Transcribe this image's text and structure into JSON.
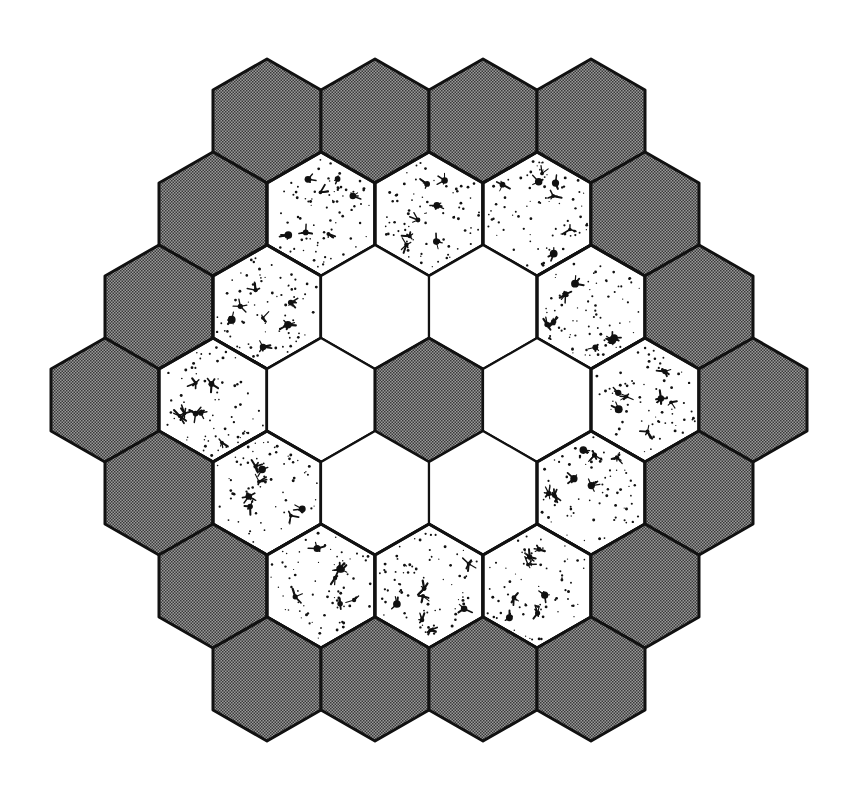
{
  "diagram": {
    "title": "",
    "colors": {
      "background": "#ffffff",
      "stroke": "#111111",
      "dark_fill": "#6e6e6e",
      "dark_fill_light": "#9a9a9a",
      "white_fill": "#ffffff",
      "speckle": "#111111"
    },
    "geometry": {
      "center_x": 429,
      "center_y": 400,
      "hex_half_width": 54,
      "hex_radius": 62,
      "row_spacing": 93
    },
    "rings": [
      {
        "ring": 0,
        "type": "dark",
        "count": 1
      },
      {
        "ring": 1,
        "type": "white",
        "count": 6
      },
      {
        "ring": 2,
        "type": "speckled",
        "count": 12
      },
      {
        "ring": 3,
        "type": "dark",
        "count": 18
      }
    ],
    "rows": [
      {
        "row": -3,
        "cells": [
          "dark",
          "dark",
          "dark",
          "dark"
        ]
      },
      {
        "row": -2,
        "cells": [
          "dark",
          "speckled",
          "speckled",
          "speckled",
          "dark"
        ]
      },
      {
        "row": -1,
        "cells": [
          "dark",
          "speckled",
          "white",
          "white",
          "speckled",
          "dark"
        ]
      },
      {
        "row": 0,
        "cells": [
          "dark",
          "speckled",
          "white",
          "dark",
          "white",
          "speckled",
          "dark"
        ]
      },
      {
        "row": 1,
        "cells": [
          "dark",
          "speckled",
          "white",
          "white",
          "speckled",
          "dark"
        ]
      },
      {
        "row": 2,
        "cells": [
          "dark",
          "speckled",
          "speckled",
          "speckled",
          "dark"
        ]
      },
      {
        "row": 3,
        "cells": [
          "dark",
          "dark",
          "dark",
          "dark"
        ]
      }
    ]
  }
}
